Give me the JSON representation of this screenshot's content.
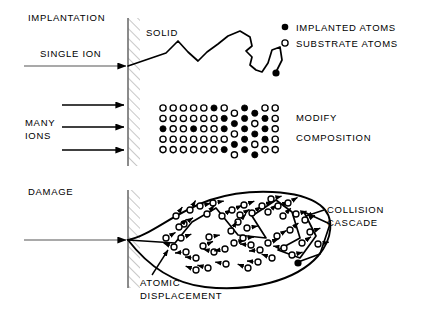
{
  "figure": {
    "panels": {
      "implantation": {
        "title": "IMPLANTATION",
        "single_ion_label": "SINGLE ION",
        "solid_label": "SOLID"
      },
      "many_ions": {
        "label_line1": "MANY",
        "label_line2": "IONS",
        "result_line1": "MODIFY",
        "result_line2": "COMPOSITION",
        "arrow_count": 3
      },
      "damage": {
        "title": "DAMAGE",
        "collision_line1": "COLLISION",
        "collision_line2": "CASCADE",
        "atomic_line1": "ATOMIC",
        "atomic_line2": "DISPLACEMENT"
      }
    },
    "legend": {
      "items": [
        {
          "marker": "filled-circle",
          "label": "IMPLANTED ATOMS"
        },
        {
          "marker": "open-circle",
          "label": "SUBSTRATE ATOMS"
        }
      ]
    },
    "colors": {
      "ink": "#000000",
      "fill_atom": "#000000",
      "open_atom": "#ffffff",
      "hatch": "#888888",
      "wall": "#777777"
    },
    "atom_grid": {
      "rows": 5,
      "cols": 12,
      "origin_x": 163,
      "origin_y": 108,
      "step_x": 10.2,
      "step_y": 10.4,
      "radius": 3.1,
      "filled_cells": [
        [
          0,
          5
        ],
        [
          0,
          8
        ],
        [
          0,
          9
        ],
        [
          1,
          6
        ],
        [
          1,
          7
        ],
        [
          1,
          8
        ],
        [
          1,
          10
        ],
        [
          2,
          0
        ],
        [
          2,
          3
        ],
        [
          2,
          6
        ],
        [
          2,
          8
        ],
        [
          2,
          9
        ],
        [
          2,
          10
        ],
        [
          3,
          7
        ],
        [
          3,
          8
        ],
        [
          3,
          10
        ],
        [
          4,
          6
        ],
        [
          4,
          8
        ],
        [
          4,
          9
        ]
      ],
      "offset_cols": [
        7,
        9
      ]
    }
  }
}
